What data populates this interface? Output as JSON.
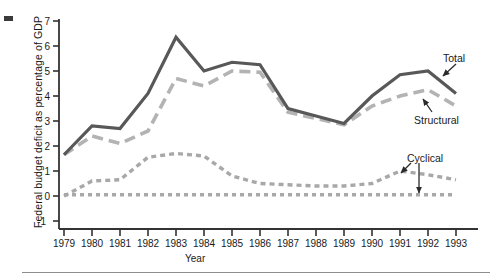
{
  "figure": {
    "title": "",
    "axis_title_x": "Year",
    "axis_title_y": "Federal budget deficit as percentage of GDP"
  },
  "annotations": {
    "total": "Total",
    "structural": "Structural",
    "cyclical": "Cyclical"
  },
  "colors": {
    "total_line": "#585858",
    "structural_line": "#b3b3b3",
    "cyclical_line": "#a8a8a8",
    "baseline_line": "#a8a8a8",
    "axis": "#333333",
    "text": "#1a1a1a",
    "footer_rule": "#8e8e8e"
  },
  "chart_data": {
    "type": "line",
    "title": "",
    "xlabel": "Year",
    "ylabel": "Federal budget deficit as percentage of GDP",
    "xlim": [
      1979,
      1993
    ],
    "ylim": [
      -1,
      7
    ],
    "yticks": [
      -1,
      0,
      1,
      2,
      3,
      4,
      5,
      6,
      7
    ],
    "grid": false,
    "legend": "inline-annotations",
    "x": [
      1979,
      1980,
      1981,
      1982,
      1983,
      1984,
      1985,
      1986,
      1987,
      1988,
      1989,
      1990,
      1991,
      1992,
      1993
    ],
    "categories": [
      "1979",
      "1980",
      "1981",
      "1982",
      "1983",
      "1984",
      "1985",
      "1986",
      "1987",
      "1988",
      "1989",
      "1990",
      "1991",
      "1992",
      "1993"
    ],
    "series": [
      {
        "name": "Total",
        "style": "solid",
        "color": "#585858",
        "values": [
          1.65,
          2.8,
          2.7,
          4.1,
          6.35,
          5.0,
          5.35,
          5.25,
          3.5,
          3.2,
          2.9,
          4.0,
          4.85,
          5.0,
          4.1
        ]
      },
      {
        "name": "Structural",
        "style": "dashed",
        "color": "#b3b3b3",
        "values": [
          1.65,
          2.4,
          2.1,
          2.6,
          4.7,
          4.4,
          5.0,
          4.95,
          3.35,
          3.1,
          2.85,
          3.6,
          4.0,
          4.25,
          3.6
        ]
      },
      {
        "name": "Cyclical",
        "style": "dotted",
        "color": "#a8a8a8",
        "values": [
          0.0,
          0.6,
          0.65,
          1.55,
          1.7,
          1.6,
          0.8,
          0.5,
          0.45,
          0.4,
          0.4,
          0.5,
          1.0,
          0.85,
          0.65
        ]
      },
      {
        "name": "Zero baseline",
        "style": "dotted",
        "color": "#a8a8a8",
        "values": [
          0.05,
          0.05,
          0.05,
          0.05,
          0.05,
          0.05,
          0.05,
          0.05,
          0.05,
          0.05,
          0.05,
          0.05,
          0.05,
          0.05,
          0.05
        ]
      }
    ]
  }
}
